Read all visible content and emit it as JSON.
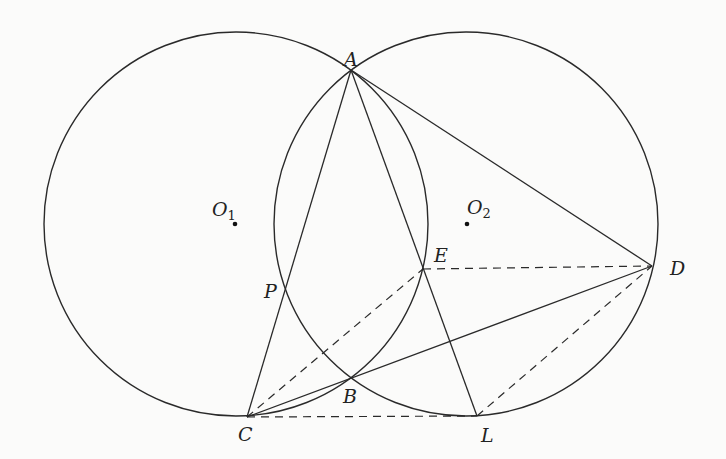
{
  "diagram": {
    "type": "geometry",
    "colors": {
      "stroke": "#2a2a2a",
      "background": "#fbfbfa"
    },
    "circles": [
      {
        "name": "O1",
        "cx": 236,
        "cy": 224,
        "r": 192
      },
      {
        "name": "O2",
        "cx": 466,
        "cy": 224,
        "r": 192
      }
    ],
    "points": {
      "A": {
        "x": 351,
        "y": 70,
        "label": "A"
      },
      "B": {
        "x": 351,
        "y": 379,
        "label": "B"
      },
      "C": {
        "x": 247,
        "y": 417,
        "label": "C"
      },
      "D": {
        "x": 652,
        "y": 266,
        "label": "D"
      },
      "E": {
        "x": 423,
        "y": 269,
        "label": "E"
      },
      "L": {
        "x": 477,
        "y": 416,
        "label": "L"
      },
      "P": {
        "x": 286,
        "y": 287,
        "label": "P"
      },
      "O1": {
        "x": 235,
        "y": 224,
        "label": "O",
        "sub": "1"
      },
      "O2": {
        "x": 467,
        "y": 224,
        "label": "O",
        "sub": "2"
      }
    },
    "solid_segments": [
      [
        "A",
        "C"
      ],
      [
        "A",
        "L"
      ],
      [
        "A",
        "D"
      ],
      [
        "C",
        "D"
      ]
    ],
    "dashed_segments": [
      [
        "C",
        "E"
      ],
      [
        "E",
        "D"
      ],
      [
        "C",
        "L"
      ],
      [
        "L",
        "D"
      ]
    ]
  }
}
